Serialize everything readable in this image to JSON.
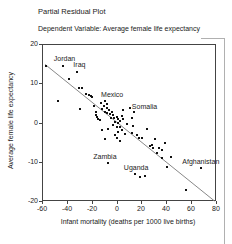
{
  "title": "Partial Residual Plot",
  "subtitle": "Dependent Variable: Average female life expectancy",
  "colors": {
    "marker": "#111111",
    "fit_line": "#888888",
    "axis": "#444444",
    "text": "#222222",
    "window_frame": "#b0b0b0"
  },
  "chart_data": {
    "type": "scatter",
    "title": "Partial Residual Plot",
    "subtitle": "Dependent Variable: Average female life expectancy",
    "xlabel": "Infant mortality (deaths per 1000 live births)",
    "ylabel": "Average female life expectancy",
    "xlim": [
      -60,
      80
    ],
    "ylim": [
      -20,
      20
    ],
    "x_ticks": [
      -60,
      -40,
      -20,
      0,
      20,
      40,
      60,
      80
    ],
    "y_ticks": [
      20,
      10,
      0,
      -10,
      -20
    ],
    "grid": false,
    "legend": null,
    "marker": {
      "shape": "square",
      "size_px": 2
    },
    "fit_line": {
      "x1": -57.5,
      "y1": 14.8,
      "x2": 78.8,
      "y2": -20.0
    },
    "labeled_points": [
      {
        "name": "Jordan",
        "x": -43.5,
        "y": 14.5,
        "dx": 2,
        "dy": -8
      },
      {
        "name": "Iraq",
        "x": -31.5,
        "y": 13.0,
        "dx": 2,
        "dy": -7.5
      },
      {
        "name": "Mexico",
        "x": -12.8,
        "y": 5.0,
        "dx": 11.5,
        "dy": -8.5
      },
      {
        "name": "Somalia",
        "x": 14.0,
        "y": 2.7,
        "dx": 10.5,
        "dy": -6
      },
      {
        "name": "Zambia",
        "x": -7.0,
        "y": -10.4,
        "dx": -3,
        "dy": -7
      },
      {
        "name": "Uganda",
        "x": 14.9,
        "y": -13.1,
        "dx": 1,
        "dy": -6.5
      },
      {
        "name": "Afghanistan",
        "x": 67.8,
        "y": -11.5,
        "dx": 0,
        "dy": -7
      }
    ],
    "points": [
      [
        -56.5,
        14.3
      ],
      [
        -38,
        11
      ],
      [
        -47.5,
        5.5
      ],
      [
        -30.5,
        8.7
      ],
      [
        -28,
        8.7
      ],
      [
        -24.5,
        7.2
      ],
      [
        -22.5,
        7.0
      ],
      [
        -21,
        6.7
      ],
      [
        -19.5,
        6.4
      ],
      [
        -29.5,
        3.4
      ],
      [
        -18.5,
        4.3
      ],
      [
        -16.8,
        1.8
      ],
      [
        -15,
        1.0
      ],
      [
        -16.3,
        2.8
      ],
      [
        -15.5,
        1.5
      ],
      [
        -13.5,
        0.6
      ],
      [
        -12,
        -2.0
      ],
      [
        -9.5,
        5.6
      ],
      [
        -8,
        4.7
      ],
      [
        -10,
        4.1
      ],
      [
        -11.5,
        3.5
      ],
      [
        -8,
        3.7
      ],
      [
        -6.5,
        3.2
      ],
      [
        -9.5,
        2.6
      ],
      [
        -7.5,
        2.4
      ],
      [
        -5.5,
        2.1
      ],
      [
        -4,
        2.6
      ],
      [
        -3,
        1.9
      ],
      [
        -4.5,
        1.2
      ],
      [
        -2,
        1.1
      ],
      [
        0,
        1.5
      ],
      [
        1.5,
        0.9
      ],
      [
        -1.5,
        0.2
      ],
      [
        0.8,
        0
      ],
      [
        2.7,
        0.3
      ],
      [
        5.4,
        3.2
      ],
      [
        4.5,
        1.6
      ],
      [
        5.5,
        0.8
      ],
      [
        8.1,
        -0.3
      ],
      [
        -6.8,
        -1.6
      ],
      [
        -2.8,
        -0.7
      ],
      [
        0,
        -1.1
      ],
      [
        2.7,
        -1.1
      ],
      [
        4.1,
        -2.0
      ],
      [
        1.3,
        -2.4
      ],
      [
        6.8,
        -2.9
      ],
      [
        -1.4,
        -3.2
      ],
      [
        10.8,
        3.7
      ],
      [
        12.2,
        1.1
      ],
      [
        13,
        -0.8
      ],
      [
        12.2,
        -2.6
      ],
      [
        16.3,
        -3.2
      ],
      [
        18.4,
        -3.9
      ],
      [
        20.3,
        -3.9
      ],
      [
        -9.5,
        -4.3
      ],
      [
        0,
        -3.9
      ],
      [
        2.7,
        -4.7
      ],
      [
        24.4,
        -1.7
      ],
      [
        28.5,
        -5.6
      ],
      [
        27,
        -6.1
      ],
      [
        29,
        -6.5
      ],
      [
        31.2,
        -4.3
      ],
      [
        33.9,
        -6.5
      ],
      [
        36.6,
        -6.9
      ],
      [
        39.3,
        -5.2
      ],
      [
        32.6,
        -7.8
      ],
      [
        36.6,
        -9.1
      ],
      [
        40.7,
        -11.3
      ],
      [
        43.4,
        -8.7
      ],
      [
        19,
        -13.8
      ],
      [
        23,
        -13.5
      ],
      [
        55.8,
        -17.2
      ]
    ]
  }
}
